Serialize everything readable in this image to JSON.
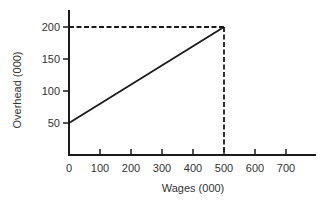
{
  "chart_data": {
    "type": "line",
    "title": "",
    "xlabel": "Wages (000)",
    "ylabel": "Overhead (000)",
    "xlim": [
      0,
      800
    ],
    "ylim": [
      0,
      225
    ],
    "x_ticks": [
      0,
      100,
      200,
      300,
      400,
      500,
      600,
      700
    ],
    "y_ticks": [
      50,
      100,
      150,
      200
    ],
    "grid": false,
    "legend": null,
    "series": [
      {
        "name": "Overhead vs Wages",
        "x": [
          0,
          500
        ],
        "y": [
          50,
          200
        ],
        "style": "solid"
      }
    ],
    "reference_lines": [
      {
        "type": "horizontal",
        "y": 200,
        "x_range": [
          0,
          500
        ],
        "style": "dashed"
      },
      {
        "type": "vertical",
        "x": 500,
        "y_range": [
          0,
          200
        ],
        "style": "dashed"
      }
    ]
  },
  "colors": {
    "line": "#1a1a1a",
    "axis": "#1a1a1a",
    "background": "#ffffff"
  }
}
